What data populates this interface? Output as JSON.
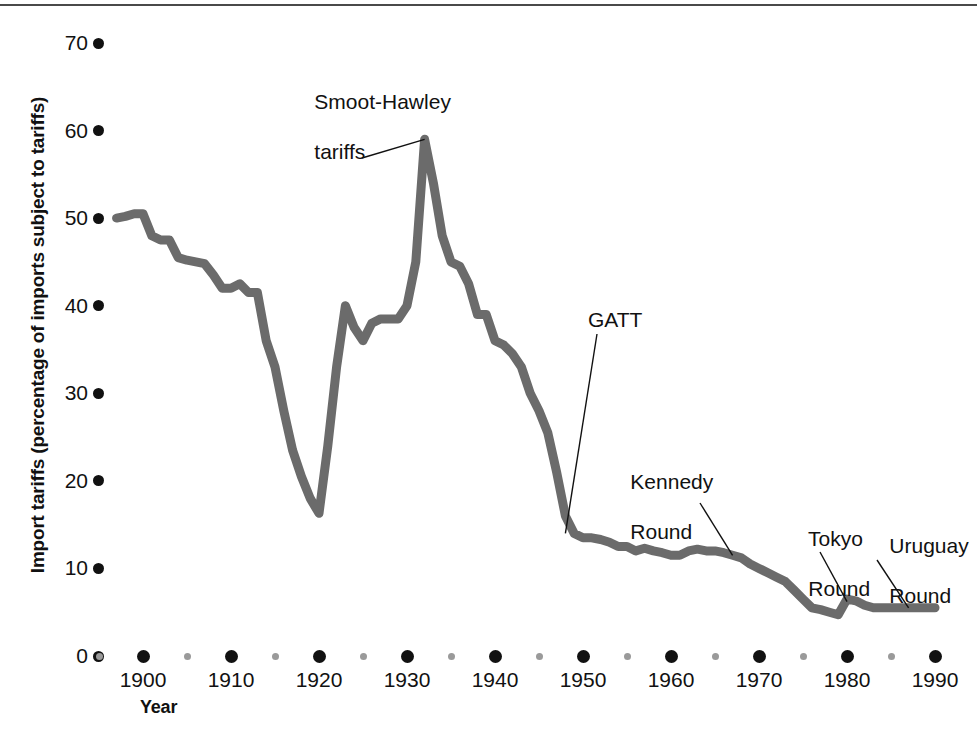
{
  "chart_data": {
    "type": "line",
    "title": "",
    "xlabel": "Year",
    "ylabel": "Import tariffs (percentage of imports subject to tariffs)",
    "xlim": [
      1895,
      1992
    ],
    "ylim": [
      0,
      70
    ],
    "grid": false,
    "legend": "none",
    "line_color": "#6b6b6b",
    "axis_color": "#111111",
    "minor_tick_color": "#9a9a9a",
    "y_ticks": [
      0,
      10,
      20,
      30,
      40,
      50,
      60,
      70
    ],
    "x_ticks": [
      1900,
      1910,
      1920,
      1930,
      1940,
      1950,
      1960,
      1970,
      1980,
      1990
    ],
    "x_minor_ticks": [
      1895,
      1905,
      1915,
      1925,
      1935,
      1945,
      1955,
      1965,
      1975,
      1985
    ],
    "series": [
      {
        "name": "Import tariffs",
        "x": [
          1897,
          1898,
          1899,
          1900,
          1901,
          1902,
          1903,
          1904,
          1905,
          1906,
          1907,
          1908,
          1909,
          1910,
          1911,
          1912,
          1913,
          1914,
          1915,
          1916,
          1917,
          1918,
          1919,
          1920,
          1921,
          1922,
          1923,
          1924,
          1925,
          1926,
          1927,
          1928,
          1929,
          1930,
          1931,
          1932,
          1933,
          1934,
          1935,
          1936,
          1937,
          1938,
          1939,
          1940,
          1941,
          1942,
          1943,
          1944,
          1945,
          1946,
          1947,
          1948,
          1949,
          1950,
          1951,
          1952,
          1953,
          1954,
          1955,
          1956,
          1957,
          1958,
          1959,
          1960,
          1961,
          1962,
          1963,
          1964,
          1965,
          1966,
          1967,
          1968,
          1969,
          1970,
          1971,
          1972,
          1973,
          1974,
          1975,
          1976,
          1977,
          1978,
          1979,
          1980,
          1981,
          1982,
          1983,
          1984,
          1985,
          1986,
          1987,
          1988,
          1989,
          1990
        ],
        "y": [
          50.0,
          50.2,
          50.5,
          50.5,
          48.0,
          47.5,
          47.5,
          45.5,
          45.2,
          45.0,
          44.8,
          43.5,
          42.0,
          42.0,
          42.5,
          41.5,
          41.5,
          36.0,
          33.0,
          28.0,
          23.5,
          20.5,
          18.0,
          16.3,
          24.0,
          33.0,
          40.0,
          37.5,
          36.0,
          38.0,
          38.5,
          38.5,
          38.5,
          40.0,
          45.0,
          59.0,
          54.0,
          48.0,
          45.0,
          44.5,
          42.5,
          39.0,
          39.0,
          36.0,
          35.5,
          34.5,
          33.0,
          30.0,
          28.0,
          25.5,
          21.0,
          16.0,
          14.0,
          13.5,
          13.5,
          13.3,
          13.0,
          12.5,
          12.5,
          12.0,
          12.3,
          12.0,
          11.8,
          11.5,
          11.5,
          12.0,
          12.2,
          12.0,
          12.0,
          11.8,
          11.5,
          11.2,
          10.5,
          10.0,
          9.5,
          9.0,
          8.5,
          7.5,
          6.5,
          5.5,
          5.3,
          5.0,
          4.7,
          6.5,
          6.3,
          5.8,
          5.5,
          5.5,
          5.5,
          5.5,
          5.5,
          5.5,
          5.5,
          5.5
        ]
      }
    ],
    "annotations": [
      {
        "label": "Smoot-Hawley\ntariffs",
        "points_to_year": 1932,
        "points_to_value": 59
      },
      {
        "label": "GATT",
        "points_to_year": 1948,
        "points_to_value": 14
      },
      {
        "label": "Kennedy\nRound",
        "points_to_year": 1967,
        "points_to_value": 11.5
      },
      {
        "label": "Tokyo\nRound",
        "points_to_year": 1980,
        "points_to_value": 6.2
      },
      {
        "label": "Uruguay\nRound",
        "points_to_year": 1987,
        "points_to_value": 5.5
      }
    ]
  },
  "axes": {
    "y_tick_labels": [
      "70",
      "60",
      "50",
      "40",
      "30",
      "20",
      "10",
      "0"
    ],
    "x_tick_labels": [
      "1900",
      "1910",
      "1920",
      "1930",
      "1940",
      "1950",
      "1960",
      "1970",
      "1980",
      "1990"
    ],
    "x_title": "Year",
    "y_title": "Import tariffs (percentage of imports subject to tariffs)"
  },
  "annotations": {
    "smoot_hawley_line1": "Smoot-Hawley",
    "smoot_hawley_line2": "tariffs",
    "gatt": "GATT",
    "kennedy_line1": "Kennedy",
    "kennedy_line2": "Round",
    "tokyo_line1": "Tokyo",
    "tokyo_line2": "Round",
    "uruguay_line1": "Uruguay",
    "uruguay_line2": "Round"
  }
}
